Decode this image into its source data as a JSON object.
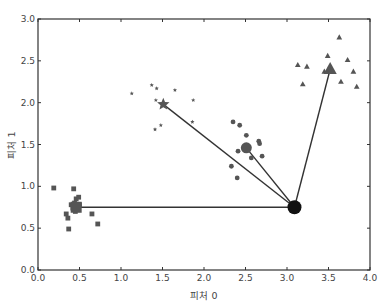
{
  "chart_data": {
    "type": "scatter",
    "title": "",
    "xlabel": "피처 0",
    "ylabel": "피처 1",
    "xlim": [
      0.0,
      4.0
    ],
    "ylim": [
      0.0,
      3.0
    ],
    "xticks": [
      "0.0",
      "0.5",
      "1.0",
      "1.5",
      "2.0",
      "2.5",
      "3.0",
      "3.5",
      "4.0"
    ],
    "yticks": [
      "0.0",
      "0.5",
      "1.0",
      "1.5",
      "2.0",
      "2.5",
      "3.0"
    ],
    "grid": false,
    "legend": null,
    "color": "#555555",
    "series": [
      {
        "name": "cluster-squares",
        "marker": "square",
        "points": [
          [
            0.19,
            0.98
          ],
          [
            0.43,
            0.97
          ],
          [
            0.46,
            0.85
          ],
          [
            0.49,
            0.87
          ],
          [
            0.44,
            0.8
          ],
          [
            0.5,
            0.78
          ],
          [
            0.42,
            0.74
          ],
          [
            0.48,
            0.72
          ],
          [
            0.45,
            0.7
          ],
          [
            0.65,
            0.67
          ],
          [
            0.72,
            0.55
          ],
          [
            0.37,
            0.49
          ],
          [
            0.36,
            0.62
          ],
          [
            0.34,
            0.67
          ],
          [
            0.4,
            0.78
          ]
        ],
        "center": [
          0.46,
          0.75
        ]
      },
      {
        "name": "cluster-stars",
        "marker": "star",
        "points": [
          [
            1.13,
            2.11
          ],
          [
            1.37,
            2.21
          ],
          [
            1.43,
            2.17
          ],
          [
            1.65,
            2.15
          ],
          [
            1.42,
            2.03
          ],
          [
            1.87,
            2.03
          ],
          [
            1.86,
            1.77
          ],
          [
            1.48,
            1.73
          ],
          [
            1.41,
            1.68
          ]
        ],
        "center": [
          1.51,
          1.98
        ]
      },
      {
        "name": "cluster-circles",
        "marker": "circle",
        "points": [
          [
            2.35,
            1.77
          ],
          [
            2.43,
            1.73
          ],
          [
            2.51,
            1.61
          ],
          [
            2.66,
            1.54
          ],
          [
            2.67,
            1.51
          ],
          [
            2.41,
            1.42
          ],
          [
            2.7,
            1.36
          ],
          [
            2.57,
            1.34
          ],
          [
            2.33,
            1.24
          ],
          [
            2.4,
            1.1
          ]
        ],
        "center": [
          2.51,
          1.46
        ]
      },
      {
        "name": "cluster-triangles",
        "marker": "triangle",
        "points": [
          [
            3.63,
            2.78
          ],
          [
            3.49,
            2.56
          ],
          [
            3.73,
            2.51
          ],
          [
            3.13,
            2.45
          ],
          [
            3.24,
            2.43
          ],
          [
            3.45,
            2.37
          ],
          [
            3.8,
            2.37
          ],
          [
            3.65,
            2.25
          ],
          [
            3.19,
            2.22
          ],
          [
            3.84,
            2.19
          ]
        ],
        "center": [
          3.52,
          2.4
        ]
      }
    ],
    "query_point": {
      "marker": "circle-large",
      "color": "#111111",
      "x": 3.09,
      "y": 0.75
    },
    "connections": "lines from query_point to each cluster center"
  }
}
